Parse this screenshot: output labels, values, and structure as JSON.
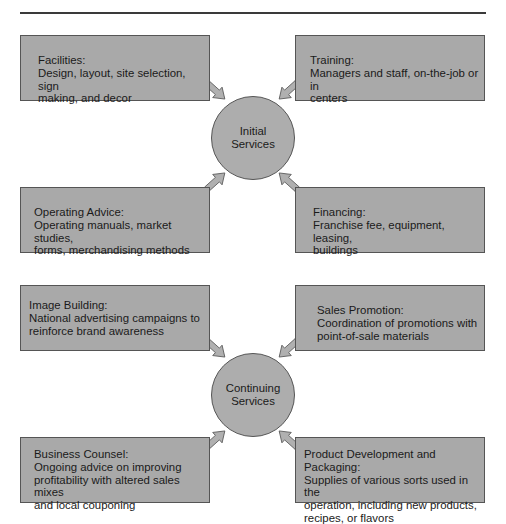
{
  "diagram": {
    "groups": [
      {
        "hub": {
          "label": "Initial\nServices"
        },
        "boxes": [
          {
            "title": "Facilities:",
            "desc": "Design, layout, site selection, sign\nmaking, and decor"
          },
          {
            "title": "Training:",
            "desc": "Managers and staff, on-the-job or in\ncenters"
          },
          {
            "title": "Operating Advice:",
            "desc": "Operating manuals, market studies,\nforms, merchandising methods"
          },
          {
            "title": "Financing:",
            "desc": "Franchise fee, equipment, leasing,\nbuildings"
          }
        ]
      },
      {
        "hub": {
          "label": "Continuing\nServices"
        },
        "boxes": [
          {
            "title": "Image Building:",
            "desc": "National advertising campaigns to\nreinforce brand awareness"
          },
          {
            "title": "Sales Promotion:",
            "desc": "Coordination of promotions with\npoint-of-sale materials"
          },
          {
            "title": "Business Counsel:",
            "desc": "Ongoing advice on improving\nprofitability with altered sales mixes\nand local couponing"
          },
          {
            "title": "Product Development and Packaging:",
            "desc": "Supplies of various sorts used in the\noperation, including new products,\nrecipes, or flavors"
          }
        ]
      }
    ],
    "colors": {
      "box_fill": "#a9a9a9",
      "hub_fill": "#adadad",
      "border": "#555555",
      "arrow_fill": "#b0b0b0"
    }
  }
}
